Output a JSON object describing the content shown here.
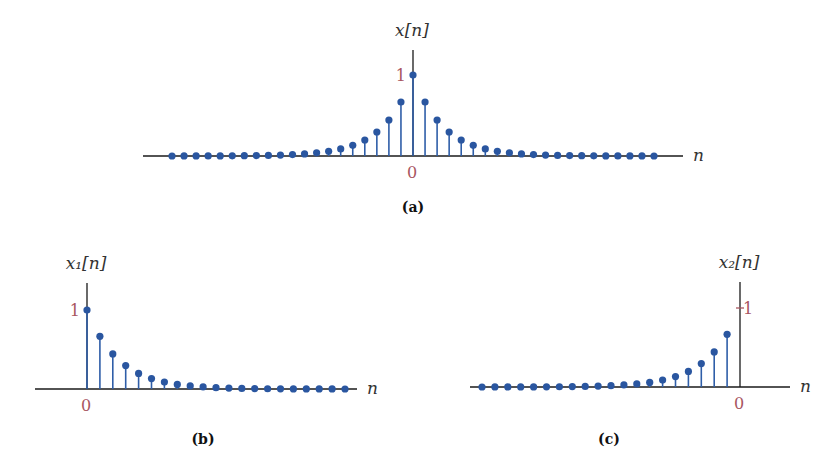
{
  "chart_data": [
    {
      "id": "a",
      "type": "stem",
      "caption": "(a)",
      "ylabel": "x[n]",
      "xlabel": "n",
      "tick_labels": {
        "y_one": "1",
        "x_zero": "0"
      },
      "formula_hint": "x[n] = (2/3)^|n|",
      "n_range": [
        -20,
        20
      ],
      "x": [
        -20,
        -19,
        -18,
        -17,
        -16,
        -15,
        -14,
        -13,
        -12,
        -11,
        -10,
        -9,
        -8,
        -7,
        -6,
        -5,
        -4,
        -3,
        -2,
        -1,
        0,
        1,
        2,
        3,
        4,
        5,
        6,
        7,
        8,
        9,
        10,
        11,
        12,
        13,
        14,
        15,
        16,
        17,
        18,
        19,
        20
      ],
      "values": [
        0.0003,
        0.0005,
        0.0007,
        0.001,
        0.0015,
        0.0023,
        0.0034,
        0.0051,
        0.0077,
        0.0116,
        0.0173,
        0.026,
        0.039,
        0.0585,
        0.0878,
        0.1317,
        0.1975,
        0.2963,
        0.4444,
        0.6667,
        1.0,
        0.6667,
        0.4444,
        0.2963,
        0.1975,
        0.1317,
        0.0878,
        0.0585,
        0.039,
        0.026,
        0.0173,
        0.0116,
        0.0077,
        0.0051,
        0.0034,
        0.0023,
        0.0015,
        0.001,
        0.0007,
        0.0005,
        0.0003
      ],
      "ylim": [
        0,
        1.3
      ],
      "grid": false,
      "layout": {
        "origin_x": 413,
        "baseline_y": 156,
        "unit_px": 81,
        "spacing_px": 12.05,
        "axis_left": 143,
        "axis_right": 683,
        "axis_top": 50,
        "caption_x": 413,
        "caption_y": 212
      }
    },
    {
      "id": "b",
      "type": "stem",
      "caption": "(b)",
      "ylabel": "x₁[n]",
      "xlabel": "n",
      "tick_labels": {
        "y_one": "1",
        "x_zero": "0"
      },
      "formula_hint": "x1[n] = (2/3)^n u[n]",
      "n_range": [
        0,
        20
      ],
      "x": [
        0,
        1,
        2,
        3,
        4,
        5,
        6,
        7,
        8,
        9,
        10,
        11,
        12,
        13,
        14,
        15,
        16,
        17,
        18,
        19,
        20
      ],
      "values": [
        1.0,
        0.6667,
        0.4444,
        0.2963,
        0.1975,
        0.1317,
        0.0878,
        0.0585,
        0.039,
        0.026,
        0.0173,
        0.0116,
        0.0077,
        0.0051,
        0.0034,
        0.0023,
        0.0015,
        0.001,
        0.0007,
        0.0005,
        0.0003
      ],
      "ylim": [
        0,
        1.3
      ],
      "grid": false,
      "layout": {
        "origin_x": 87,
        "baseline_y": 389,
        "unit_px": 79,
        "spacing_px": 12.9,
        "axis_left": 35,
        "axis_right": 357,
        "axis_top": 283,
        "caption_x": 203,
        "caption_y": 444
      }
    },
    {
      "id": "c",
      "type": "stem",
      "caption": "(c)",
      "ylabel": "x₂[n]",
      "xlabel": "n",
      "tick_labels": {
        "y_one": "1",
        "x_zero": "0"
      },
      "formula_hint": "x2[n] = (2/3)^(-n) u[-n-1]",
      "n_range": [
        -20,
        -1
      ],
      "x": [
        -20,
        -19,
        -18,
        -17,
        -16,
        -15,
        -14,
        -13,
        -12,
        -11,
        -10,
        -9,
        -8,
        -7,
        -6,
        -5,
        -4,
        -3,
        -2,
        -1
      ],
      "values": [
        0.0003,
        0.0005,
        0.0007,
        0.001,
        0.0015,
        0.0023,
        0.0034,
        0.0051,
        0.0077,
        0.0116,
        0.0173,
        0.026,
        0.039,
        0.0585,
        0.0878,
        0.1317,
        0.1975,
        0.2963,
        0.4444,
        0.6667
      ],
      "ylim": [
        0,
        1.3
      ],
      "grid": false,
      "layout": {
        "origin_x": 740,
        "baseline_y": 387,
        "unit_px": 79,
        "spacing_px": 12.9,
        "axis_left": 470,
        "axis_right": 790,
        "axis_top": 282,
        "caption_x": 609,
        "caption_y": 444
      }
    }
  ]
}
